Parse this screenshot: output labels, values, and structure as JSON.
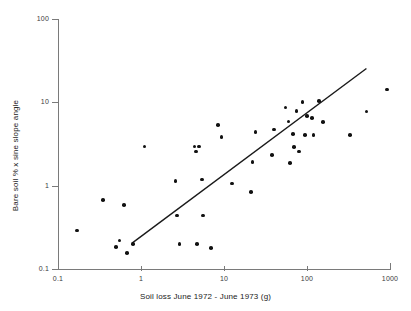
{
  "figure": {
    "title": "",
    "xlabel": "Soil loss June 1972 - June 1973 (g)",
    "ylabel": "Bare soil % x sine slope angle"
  },
  "axes": {
    "x_tick_labels": [
      "0.1",
      "1",
      "10",
      "100",
      "1000"
    ],
    "y_tick_labels": [
      "100",
      "10",
      "1",
      "0.1"
    ],
    "axis_color": "#7a7a7a",
    "point_color": "#111111",
    "line_color": "#1a1a1a"
  },
  "chart_data": {
    "type": "scatter",
    "title": "",
    "xlabel": "Soil loss June 1972 - June 1973 (g)",
    "ylabel": "Bare soil % x sine slope angle",
    "xscale": "log",
    "yscale": "log",
    "xlim": [
      0.1,
      1000
    ],
    "ylim": [
      0.1,
      100
    ],
    "xticks": [
      0.1,
      1,
      10,
      100,
      1000
    ],
    "yticks": [
      0.1,
      1,
      10,
      100
    ],
    "grid": false,
    "legend": "none",
    "marker": "filled-circle",
    "points": [
      [
        0.17,
        0.29
      ],
      [
        0.35,
        0.68
      ],
      [
        0.5,
        0.185
      ],
      [
        0.55,
        0.22
      ],
      [
        0.62,
        0.59
      ],
      [
        0.68,
        0.155
      ],
      [
        0.8,
        0.2
      ],
      [
        1.1,
        3.0
      ],
      [
        2.6,
        1.15
      ],
      [
        2.7,
        0.44
      ],
      [
        2.9,
        0.2
      ],
      [
        4.4,
        3.0
      ],
      [
        4.6,
        2.6
      ],
      [
        5.0,
        3.0
      ],
      [
        4.7,
        0.2
      ],
      [
        5.4,
        1.2
      ],
      [
        5.6,
        0.44
      ],
      [
        7.0,
        0.18
      ],
      [
        8.5,
        5.4
      ],
      [
        9.3,
        3.9
      ],
      [
        12.5,
        1.07
      ],
      [
        21.0,
        0.85
      ],
      [
        22.0,
        1.95
      ],
      [
        24.0,
        4.5
      ],
      [
        38.0,
        2.35
      ],
      [
        40.0,
        4.8
      ],
      [
        55.0,
        8.8
      ],
      [
        60.0,
        6.0
      ],
      [
        62.0,
        1.9
      ],
      [
        68.0,
        4.2
      ],
      [
        70.0,
        2.95
      ],
      [
        75.0,
        8.0
      ],
      [
        80.0,
        2.6
      ],
      [
        88.0,
        10.2
      ],
      [
        95.0,
        4.1
      ],
      [
        100.0,
        7.0
      ],
      [
        115.0,
        6.6
      ],
      [
        120.0,
        4.1
      ],
      [
        140.0,
        10.5
      ],
      [
        155.0,
        5.9
      ],
      [
        330.0,
        4.1
      ],
      [
        520.0,
        7.9
      ],
      [
        920.0,
        14.5
      ]
    ],
    "trendline": {
      "type": "linear-on-log-log",
      "x_start": 0.78,
      "y_start": 0.205,
      "x_end": 520.0,
      "y_end": 26.0
    }
  }
}
